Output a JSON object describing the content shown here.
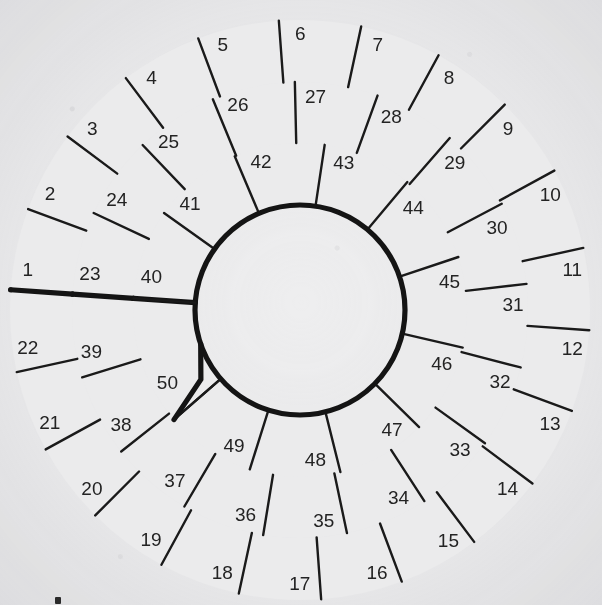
{
  "diagram": {
    "type": "spiral-grid",
    "total_cells": 50,
    "center": {
      "x": 300,
      "y": 310
    },
    "colors": {
      "background": "#eeeeef",
      "cell_fill": "#ebebec",
      "outline": "#141414",
      "divider": "#1a1a1a",
      "label": "#232323"
    },
    "radii": {
      "hub": 105,
      "ring3_inner": 105,
      "ring3_outer": 167,
      "ring2_outer": 228,
      "ring1_outer": 290,
      "band_width": 62
    },
    "rings": [
      {
        "name": "outer-ring",
        "index": 1,
        "inner_radius": 228,
        "outer_radius": 290,
        "cell_count": 22,
        "start_angle_deg": 184,
        "end_angle_deg": 544,
        "cells": [
          1,
          2,
          3,
          4,
          5,
          6,
          7,
          8,
          9,
          10,
          11,
          12,
          13,
          14,
          15,
          16,
          17,
          18,
          19,
          20,
          21,
          22
        ]
      },
      {
        "name": "second-ring",
        "index": 2,
        "inner_radius": 167,
        "outer_radius": 228,
        "cell_count": 17,
        "start_angle_deg": 184,
        "end_angle_deg": 544,
        "cells": [
          23,
          24,
          25,
          26,
          27,
          28,
          29,
          30,
          31,
          32,
          33,
          34,
          35,
          36,
          37,
          38,
          39
        ]
      },
      {
        "name": "third-ring",
        "index": 3,
        "inner_radius": 105,
        "outer_radius": 167,
        "cell_count": 10,
        "start_angle_deg": 184,
        "end_angle_deg": 499,
        "cells": [
          40,
          41,
          42,
          43,
          44,
          45,
          46,
          47,
          48,
          49
        ]
      },
      {
        "name": "terminal-cell",
        "index": 4,
        "inner_radius": 105,
        "outer_radius": 167,
        "cell_count": 1,
        "start_angle_deg": 499,
        "end_angle_deg": 544,
        "cells": [
          50
        ]
      }
    ],
    "cell_numbers": [
      "1",
      "2",
      "3",
      "4",
      "5",
      "6",
      "7",
      "8",
      "9",
      "10",
      "11",
      "12",
      "13",
      "14",
      "15",
      "16",
      "17",
      "18",
      "19",
      "20",
      "21",
      "22",
      "23",
      "24",
      "25",
      "26",
      "27",
      "28",
      "29",
      "30",
      "31",
      "32",
      "33",
      "34",
      "35",
      "36",
      "37",
      "38",
      "39",
      "40",
      "41",
      "42",
      "43",
      "44",
      "45",
      "46",
      "47",
      "48",
      "49",
      "50"
    ],
    "notes": {
      "numbering_direction": "clockwise",
      "start_position": "left, just below horizontal",
      "center": "empty hub circle",
      "spiral_terminus": "notch at upper-left of hub where band 3 meets the hub"
    }
  }
}
